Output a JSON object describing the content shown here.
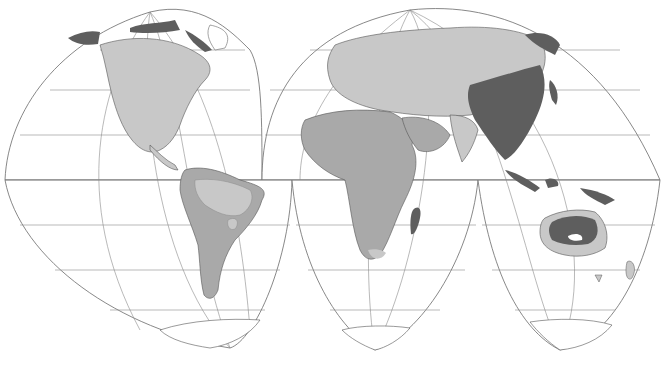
{
  "map": {
    "type": "interrupted world map (Goode-style projection)",
    "lobes": [
      "north-america",
      "eurasia-africa-north",
      "south-america",
      "africa-south",
      "oceania-south"
    ],
    "legend_visible": false,
    "labels_visible": false,
    "shading_classes": [
      {
        "name": "light",
        "color": "#c8c8c8"
      },
      {
        "name": "medium",
        "color": "#a9a9a9"
      },
      {
        "name": "dark",
        "color": "#5e5e5e"
      }
    ],
    "regions": [
      {
        "name": "north-america",
        "shade": "light"
      },
      {
        "name": "arctic-north-america",
        "shade": "dark"
      },
      {
        "name": "south-america-outer",
        "shade": "medium"
      },
      {
        "name": "south-america-inner",
        "shade": "light"
      },
      {
        "name": "europe",
        "shade": "light"
      },
      {
        "name": "northern-asia",
        "shade": "light"
      },
      {
        "name": "east-asia",
        "shade": "dark"
      },
      {
        "name": "far-east-russia",
        "shade": "dark"
      },
      {
        "name": "africa",
        "shade": "medium"
      },
      {
        "name": "southern-africa-tip",
        "shade": "light"
      },
      {
        "name": "madagascar",
        "shade": "dark"
      },
      {
        "name": "southeast-asia-islands",
        "shade": "dark"
      },
      {
        "name": "australia-interior",
        "shade": "dark"
      },
      {
        "name": "australia-coast",
        "shade": "light"
      },
      {
        "name": "new-zealand",
        "shade": "light"
      },
      {
        "name": "antarctica",
        "shade": "none"
      }
    ]
  }
}
